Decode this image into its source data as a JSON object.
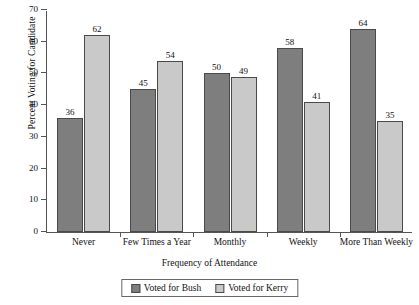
{
  "chart_data": {
    "type": "bar",
    "title": "",
    "xlabel": "Frequency of Attendance",
    "ylabel": "Percent Voting for Candidate",
    "categories": [
      "Never",
      "Few Times a Year",
      "Monthly",
      "Weekly",
      "More Than Weekly"
    ],
    "series": [
      {
        "name": "Voted for Bush",
        "color": "#7e7e7e",
        "values": [
          36,
          45,
          50,
          58,
          64
        ]
      },
      {
        "name": "Voted for Kerry",
        "color": "#c9c9c9",
        "values": [
          62,
          54,
          49,
          41,
          35
        ]
      }
    ],
    "ylim": [
      0,
      70
    ],
    "yticks": [
      0,
      10,
      20,
      30,
      40,
      50,
      60,
      70
    ],
    "ytick_labels": [
      "0",
      "10",
      "20",
      "30",
      "40",
      "50",
      "60",
      "70"
    ],
    "grid": false,
    "legend_position": "bottom-center",
    "data_labels": true
  },
  "legend": {
    "items": [
      {
        "label": "Voted for Bush",
        "swatch": "bush"
      },
      {
        "label": "Voted for Kerry",
        "swatch": "kerry"
      }
    ]
  }
}
